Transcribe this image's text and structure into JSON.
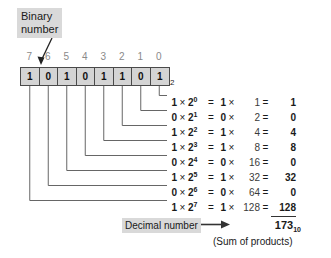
{
  "binary_callout": {
    "label": "Binary\nnumber"
  },
  "binary": {
    "digits": [
      "1",
      "0",
      "1",
      "0",
      "1",
      "1",
      "0",
      "1"
    ],
    "positions": [
      "7",
      "6",
      "5",
      "4",
      "3",
      "2",
      "1",
      "0"
    ],
    "base_subscript": "2",
    "value_string": "10101101"
  },
  "equations": [
    {
      "bit": "1",
      "times": "×",
      "base": "2",
      "exp": "0",
      "eq": "=",
      "val": "1",
      "times2": "×",
      "weight": "1",
      "eq2": "=",
      "product": "1"
    },
    {
      "bit": "0",
      "times": "×",
      "base": "2",
      "exp": "1",
      "eq": "=",
      "val": "0",
      "times2": "×",
      "weight": "2",
      "eq2": "=",
      "product": "0"
    },
    {
      "bit": "1",
      "times": "×",
      "base": "2",
      "exp": "2",
      "eq": "=",
      "val": "1",
      "times2": "×",
      "weight": "4",
      "eq2": "=",
      "product": "4"
    },
    {
      "bit": "1",
      "times": "×",
      "base": "2",
      "exp": "3",
      "eq": "=",
      "val": "1",
      "times2": "×",
      "weight": "8",
      "eq2": "=",
      "product": "8"
    },
    {
      "bit": "0",
      "times": "×",
      "base": "2",
      "exp": "4",
      "eq": "=",
      "val": "0",
      "times2": "×",
      "weight": "16",
      "eq2": "=",
      "product": "0"
    },
    {
      "bit": "1",
      "times": "×",
      "base": "2",
      "exp": "5",
      "eq": "=",
      "val": "1",
      "times2": "×",
      "weight": "32",
      "eq2": "=",
      "product": "32"
    },
    {
      "bit": "0",
      "times": "×",
      "base": "2",
      "exp": "6",
      "eq": "=",
      "val": "0",
      "times2": "×",
      "weight": "64",
      "eq2": "=",
      "product": "0"
    },
    {
      "bit": "1",
      "times": "×",
      "base": "2",
      "exp": "7",
      "eq": "=",
      "val": "1",
      "times2": "×",
      "weight": "128",
      "eq2": "=",
      "product": "128"
    }
  ],
  "result": {
    "decimal_label": "Decimal number",
    "arrow": "➡",
    "total": "173",
    "total_subscript": "10",
    "note": "(Sum of products)"
  },
  "colors": {
    "box_fill": "#d4d4d4",
    "box_border": "#4a4a4a",
    "callout_fill": "#d9d9d9",
    "text": "#1a1a1a",
    "muted_text": "#8a8a8a",
    "leader_line": "#555555"
  }
}
